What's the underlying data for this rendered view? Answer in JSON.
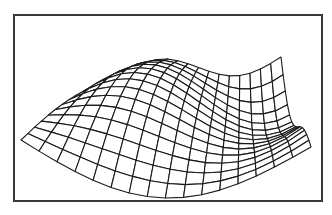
{
  "figure": {
    "type": "3d-wireframe-surface",
    "frame_color": "#3a3a3a",
    "line_color": "#1a1a1a",
    "background": "#ffffff"
  },
  "mesh": {
    "grid_u": 16,
    "grid_v": 14,
    "corners": {
      "front_left": [
        21,
        140
      ],
      "front_bottom": [
        163,
        198
      ],
      "front_right": [
        311,
        147
      ],
      "back_far": [
        175,
        92
      ]
    },
    "height_scale": 38,
    "wave_u_freq": 1.6,
    "wave_v_freq": 1.0
  }
}
